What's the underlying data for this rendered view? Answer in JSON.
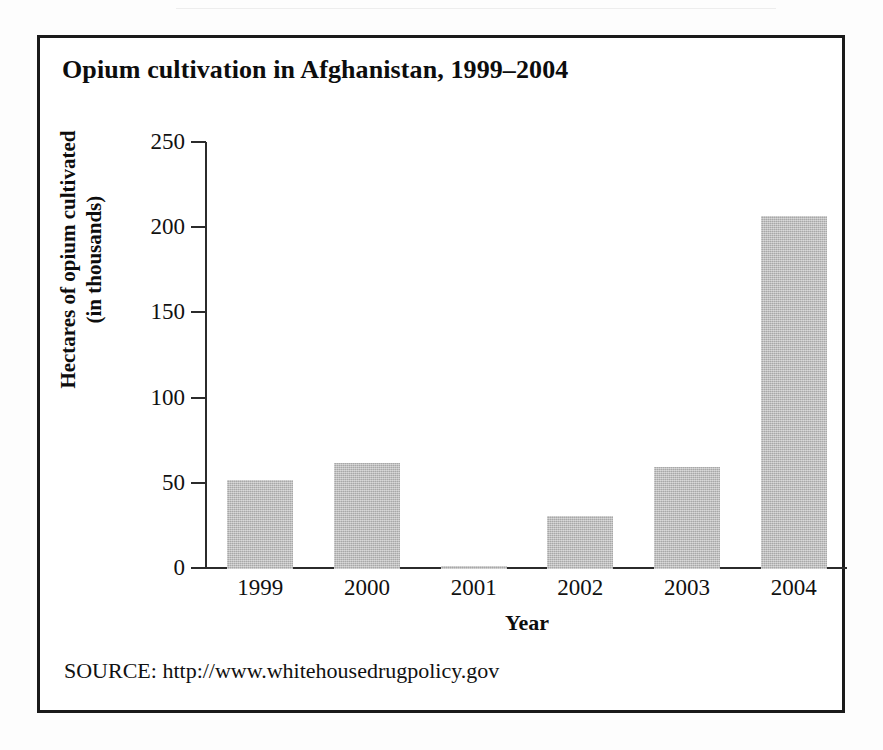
{
  "figure": {
    "title": "Opium cultivation in Afghanistan, 1999–2004",
    "source": "SOURCE: http://www.whitehousedrugpolicy.gov",
    "frame_color": "#1a1a1a",
    "background": "#ffffff"
  },
  "chart_data": {
    "type": "bar",
    "title": "Opium cultivation in Afghanistan, 1999–2004",
    "categories": [
      "1999",
      "2000",
      "2001",
      "2002",
      "2003",
      "2004"
    ],
    "values": [
      52,
      62,
      2,
      31,
      60,
      207
    ],
    "xlabel": "Year",
    "ylabel": "Hectares of opium cultivated (in thousands)",
    "ylabel_line1": "Hectares of opium cultivated",
    "ylabel_line2": "(in thousands)",
    "ylim": [
      0,
      250
    ],
    "yticks": [
      0,
      50,
      100,
      150,
      200,
      250
    ],
    "ytick_labels": [
      "0",
      "50",
      "100",
      "150",
      "200",
      "250"
    ],
    "grid": false,
    "legend": false,
    "bar_color": "#b9b9b9",
    "axis_color": "#2b2b2b"
  }
}
